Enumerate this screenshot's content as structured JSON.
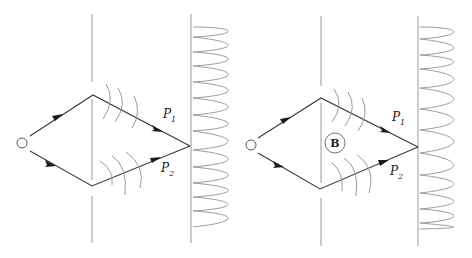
{
  "figure": {
    "panels": [
      {
        "id": "left",
        "path_labels": [
          {
            "main": "P",
            "sub": "1"
          },
          {
            "main": "P",
            "sub": "2"
          }
        ],
        "has_field_region": false
      },
      {
        "id": "right",
        "path_labels": [
          {
            "main": "P",
            "sub": "1"
          },
          {
            "main": "P",
            "sub": "2"
          }
        ],
        "has_field_region": true,
        "field_label": "B"
      }
    ],
    "colors": {
      "path": "#3a3a3a",
      "barrier": "#a8a8a8",
      "wavefront": "#9a9a9a",
      "pattern": "#9c9c9c"
    }
  }
}
